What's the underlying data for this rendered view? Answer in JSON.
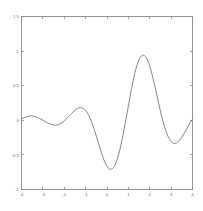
{
  "chart_data": {
    "type": "line",
    "title": "",
    "subtitle": "",
    "xlabel": "",
    "ylabel": "",
    "xlim": [
      -4,
      4
    ],
    "ylim": [
      -1,
      1.5
    ],
    "grid": false,
    "legend": null,
    "annotations": [],
    "xticks": [
      -4,
      -3,
      -2,
      -1,
      0,
      1,
      2,
      3,
      4
    ],
    "xticklabels": [
      "-4",
      "-3",
      "-2",
      "-1",
      "0",
      "1",
      "2",
      "3",
      "4"
    ],
    "yticks": [
      -1,
      -0.5,
      0,
      0.5,
      1,
      1.5
    ],
    "yticklabels": [
      "-1",
      "-0.5",
      "0",
      "0.5",
      "1",
      "1.5"
    ],
    "series": [
      {
        "name": "wavelet",
        "color": "#6f6f6f",
        "x": [
          -4.0,
          -3.9,
          -3.8,
          -3.7,
          -3.6,
          -3.5,
          -3.4,
          -3.3,
          -3.2,
          -3.1,
          -3.0,
          -2.9,
          -2.8,
          -2.7,
          -2.6,
          -2.5,
          -2.4,
          -2.3,
          -2.2,
          -2.1,
          -2.0,
          -1.9,
          -1.8,
          -1.7,
          -1.6,
          -1.5,
          -1.4,
          -1.3,
          -1.2,
          -1.1,
          -1.0,
          -0.9,
          -0.8,
          -0.7,
          -0.6,
          -0.5,
          -0.4,
          -0.3,
          -0.2,
          -0.1,
          0.0,
          0.1,
          0.2,
          0.3,
          0.4,
          0.5,
          0.6,
          0.7,
          0.8,
          0.9,
          1.0,
          1.1,
          1.2,
          1.3,
          1.4,
          1.5,
          1.6,
          1.7,
          1.8,
          1.9,
          2.0,
          2.1,
          2.2,
          2.3,
          2.4,
          2.5,
          2.6,
          2.7,
          2.8,
          2.9,
          3.0,
          3.1,
          3.2,
          3.3,
          3.4,
          3.5,
          3.6,
          3.7,
          3.8,
          3.9,
          4.0
        ],
        "y": [
          0.02,
          0.035,
          0.048,
          0.057,
          0.062,
          0.062,
          0.057,
          0.048,
          0.035,
          0.019,
          0.002,
          -0.016,
          -0.033,
          -0.048,
          -0.06,
          -0.067,
          -0.069,
          -0.064,
          -0.052,
          -0.034,
          -0.01,
          0.019,
          0.051,
          0.084,
          0.117,
          0.146,
          0.168,
          0.181,
          0.182,
          0.169,
          0.141,
          0.096,
          0.035,
          -0.041,
          -0.13,
          -0.228,
          -0.33,
          -0.431,
          -0.524,
          -0.604,
          -0.664,
          -0.7,
          -0.707,
          -0.683,
          -0.628,
          -0.541,
          -0.426,
          -0.288,
          -0.131,
          0.037,
          0.21,
          0.38,
          0.539,
          0.679,
          0.794,
          0.878,
          0.928,
          0.942,
          0.92,
          0.865,
          0.78,
          0.671,
          0.544,
          0.407,
          0.267,
          0.132,
          0.007,
          -0.102,
          -0.192,
          -0.261,
          -0.307,
          -0.331,
          -0.334,
          -0.318,
          -0.287,
          -0.244,
          -0.193,
          -0.138,
          -0.083,
          -0.031,
          0.015
        ]
      }
    ],
    "formula_hint": "oscillatory decaying wavelet, peak 1.17 at x=0, minima -0.88 at x=+/-0.72"
  },
  "axes": {
    "frame_color": "#8a8a8a",
    "tick_label_color": "#6a6a6a"
  }
}
